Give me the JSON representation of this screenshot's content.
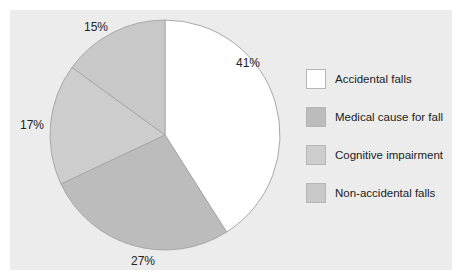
{
  "chart_data": {
    "type": "pie",
    "title": "",
    "categories": [
      "Accidental falls",
      "Medical cause for fall",
      "Cognitive impairment",
      "Non-accidental falls"
    ],
    "values": [
      41,
      27,
      17,
      15
    ],
    "labels": [
      "41%",
      "27%",
      "17%",
      "15%"
    ],
    "colors": [
      "#ffffff",
      "#bcbcbc",
      "#cdcdcd",
      "#c8c8c8"
    ],
    "start_angle": "12 o'clock, clockwise",
    "legend_position": "right"
  },
  "colors": {
    "background": "#ececec",
    "outline": "#a8a8a8"
  }
}
